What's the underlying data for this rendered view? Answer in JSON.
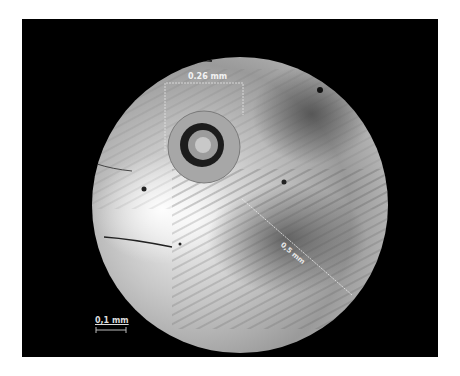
{
  "image": {
    "subject": "microscope cross-section of optical fiber end face",
    "frame_color": "#000000",
    "background_color": "#ffffff"
  },
  "annotations": {
    "core_diameter_label": "0.26 mm",
    "diagonal_measure_label": "0,5 mm",
    "scale_bar_label": "0,1 mm"
  }
}
